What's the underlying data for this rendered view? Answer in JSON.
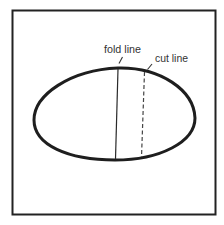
{
  "diagram": {
    "labels": {
      "fold_line": "fold line",
      "cut_line": "cut line"
    },
    "colors": {
      "stroke": "#222222",
      "text": "#333333",
      "background": "#ffffff"
    },
    "elements": [
      {
        "name": "square-frame",
        "shape": "rectangle"
      },
      {
        "name": "oval",
        "shape": "ellipse"
      },
      {
        "name": "fold-line",
        "style": "solid"
      },
      {
        "name": "cut-line",
        "style": "dashed"
      }
    ]
  }
}
